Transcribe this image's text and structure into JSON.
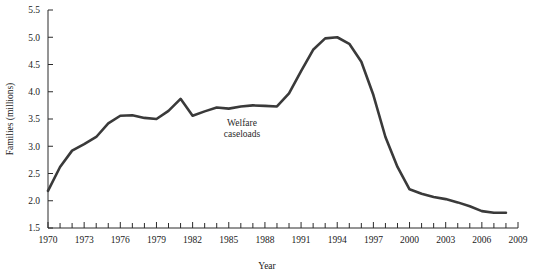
{
  "chart_data": {
    "type": "line",
    "title": "",
    "xlabel": "Year",
    "ylabel": "Families (millions)",
    "xlim": [
      1970,
      2009
    ],
    "ylim": [
      1.5,
      5.5
    ],
    "grid": false,
    "legend": null,
    "y_ticks": [
      "1.5",
      "2.0",
      "2.5",
      "3.0",
      "3.5",
      "4.0",
      "4.5",
      "5.0",
      "5.5"
    ],
    "y_tick_values": [
      1.5,
      2.0,
      2.5,
      3.0,
      3.5,
      4.0,
      4.5,
      5.0,
      5.5
    ],
    "x_ticks": [
      "1970",
      "1973",
      "1976",
      "1979",
      "1982",
      "1985",
      "1988",
      "1991",
      "1994",
      "1997",
      "2000",
      "2003",
      "2006",
      "2009"
    ],
    "x_tick_values": [
      1970,
      1973,
      1976,
      1979,
      1982,
      1985,
      1988,
      1991,
      1994,
      1997,
      2000,
      2003,
      2006,
      2009
    ],
    "x_minor_step": 1,
    "annotations": [
      {
        "text_line1": "Welfare",
        "text_line2": "caseloads",
        "x": 1986.1,
        "y": 3.37
      }
    ],
    "series": [
      {
        "name": "Welfare caseloads",
        "color": "#3a3a3a",
        "x": [
          1970,
          1971,
          1972,
          1973,
          1974,
          1975,
          1976,
          1977,
          1978,
          1979,
          1980,
          1981,
          1982,
          1983,
          1984,
          1985,
          1986,
          1987,
          1988,
          1989,
          1990,
          1991,
          1992,
          1993,
          1994,
          1995,
          1996,
          1997,
          1998,
          1999,
          2000,
          2001,
          2002,
          2003,
          2004,
          2005,
          2006,
          2007,
          2008
        ],
        "values": [
          2.18,
          2.62,
          2.92,
          3.04,
          3.17,
          3.42,
          3.56,
          3.57,
          3.52,
          3.5,
          3.65,
          3.87,
          3.56,
          3.64,
          3.71,
          3.69,
          3.73,
          3.75,
          3.74,
          3.73,
          3.97,
          4.38,
          4.77,
          4.98,
          5.0,
          4.88,
          4.55,
          3.94,
          3.17,
          2.62,
          2.21,
          2.13,
          2.07,
          2.03,
          1.97,
          1.9,
          1.81,
          1.78,
          1.78
        ]
      }
    ]
  }
}
